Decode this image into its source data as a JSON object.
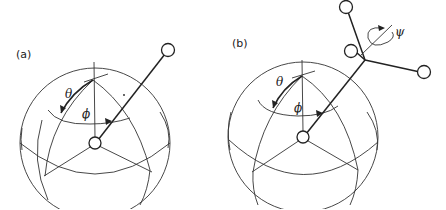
{
  "figure": {
    "panels": [
      {
        "label": "(a)",
        "description": "Linear molecule orientation on a sphere",
        "angles": {
          "theta": "θ",
          "phi": "ϕ"
        }
      },
      {
        "label": "(b)",
        "description": "Nonlinear molecule orientation with spin about its axis",
        "angles": {
          "theta": "θ",
          "phi": "ϕ",
          "psi": "ψ"
        }
      }
    ]
  },
  "colors": {
    "stroke": "#222222",
    "background": "#ffffff"
  }
}
